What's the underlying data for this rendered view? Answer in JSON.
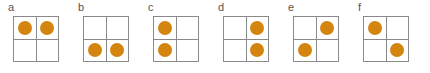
{
  "figure": {
    "background_color": "#ffffff",
    "grid_line_color": "#8a8a8a",
    "cell_fill_color": "#ffffff",
    "dot_color": "#d4850f",
    "label_color": "#555555"
  },
  "panels": [
    {
      "label": "a",
      "arrangement": "top-row",
      "cells": [
        {
          "name": "cell-top-left",
          "filled": true
        },
        {
          "name": "cell-top-right",
          "filled": true
        },
        {
          "name": "cell-bottom-left",
          "filled": false
        },
        {
          "name": "cell-bottom-right",
          "filled": false
        }
      ]
    },
    {
      "label": "b",
      "arrangement": "bottom-row",
      "cells": [
        {
          "name": "cell-top-left",
          "filled": false
        },
        {
          "name": "cell-top-right",
          "filled": false
        },
        {
          "name": "cell-bottom-left",
          "filled": true
        },
        {
          "name": "cell-bottom-right",
          "filled": true
        }
      ]
    },
    {
      "label": "c",
      "arrangement": "left-column",
      "cells": [
        {
          "name": "cell-top-left",
          "filled": true
        },
        {
          "name": "cell-top-right",
          "filled": false
        },
        {
          "name": "cell-bottom-left",
          "filled": true
        },
        {
          "name": "cell-bottom-right",
          "filled": false
        }
      ]
    },
    {
      "label": "d",
      "arrangement": "right-column",
      "cells": [
        {
          "name": "cell-top-left",
          "filled": false
        },
        {
          "name": "cell-top-right",
          "filled": true
        },
        {
          "name": "cell-bottom-left",
          "filled": false
        },
        {
          "name": "cell-bottom-right",
          "filled": true
        }
      ]
    },
    {
      "label": "e",
      "arrangement": "anti-diagonal",
      "cells": [
        {
          "name": "cell-top-left",
          "filled": false
        },
        {
          "name": "cell-top-right",
          "filled": true
        },
        {
          "name": "cell-bottom-left",
          "filled": true
        },
        {
          "name": "cell-bottom-right",
          "filled": false
        }
      ]
    },
    {
      "label": "f",
      "arrangement": "main-diagonal",
      "cells": [
        {
          "name": "cell-top-left",
          "filled": true
        },
        {
          "name": "cell-top-right",
          "filled": false
        },
        {
          "name": "cell-bottom-left",
          "filled": false
        },
        {
          "name": "cell-bottom-right",
          "filled": true
        }
      ]
    }
  ],
  "layout": {
    "panel_width": 70,
    "panel_left_offsets": [
      0,
      70,
      140,
      210,
      280,
      350
    ],
    "grid_size": 46,
    "dot_diameter": 14
  }
}
